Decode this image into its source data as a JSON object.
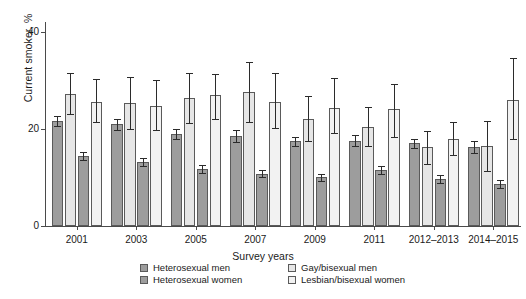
{
  "chart_data": {
    "type": "bar",
    "title": "",
    "xlabel": "Survey years",
    "ylabel": "Current smoker, %",
    "categories": [
      "2001",
      "2003",
      "2005",
      "2007",
      "2009",
      "2011",
      "2012–2013",
      "2014–2015"
    ],
    "ylim": [
      0,
      42
    ],
    "yticks": [
      0,
      20,
      40
    ],
    "ytick_labels": [
      "0",
      "20",
      "40"
    ],
    "grid": false,
    "legend_position": "bottom",
    "error_bars": "95% CI",
    "series": [
      {
        "name": "Heterosexual men",
        "color": "#9d9d9d",
        "values": [
          21.6,
          20.9,
          18.9,
          18.5,
          17.4,
          17.6,
          17.0,
          16.3
        ],
        "ci_low": [
          20.6,
          19.7,
          17.9,
          17.3,
          16.4,
          16.4,
          16.0,
          15.0
        ],
        "ci_high": [
          22.6,
          22.1,
          19.9,
          19.7,
          18.4,
          18.8,
          18.0,
          17.6
        ]
      },
      {
        "name": "Gay/bisexual men",
        "color": "#e6e6e6",
        "values": [
          27.2,
          25.3,
          26.3,
          27.6,
          22.1,
          20.4,
          16.2,
          16.5
        ],
        "ci_low": [
          23.0,
          20.0,
          21.2,
          21.4,
          17.5,
          16.4,
          12.8,
          11.4
        ],
        "ci_high": [
          31.4,
          30.6,
          31.4,
          33.8,
          26.7,
          24.4,
          19.6,
          21.6
        ]
      },
      {
        "name": "Heterosexual women",
        "color": "#9d9d9d",
        "values": [
          14.4,
          13.2,
          11.8,
          10.8,
          10.0,
          11.5,
          9.7,
          8.7
        ],
        "ci_low": [
          13.6,
          12.4,
          11.0,
          10.0,
          9.2,
          10.7,
          8.9,
          7.9
        ],
        "ci_high": [
          15.2,
          14.0,
          12.6,
          11.6,
          10.8,
          12.3,
          10.5,
          9.5
        ]
      },
      {
        "name": "Lesbian/bisexual women",
        "color": "#f2f2f2",
        "values": [
          25.6,
          24.7,
          27.0,
          25.6,
          24.3,
          24.1,
          18.0,
          26.0
        ],
        "ci_low": [
          21.4,
          19.7,
          22.0,
          20.1,
          19.2,
          18.4,
          14.6,
          17.9
        ],
        "ci_high": [
          30.2,
          30.0,
          31.2,
          31.6,
          30.4,
          29.3,
          21.4,
          34.6
        ]
      }
    ]
  },
  "legend": {
    "items": [
      {
        "label": "Heterosexual men"
      },
      {
        "label": "Gay/bisexual men"
      },
      {
        "label": "Heterosexual women"
      },
      {
        "label": "Lesbian/bisexual women"
      }
    ]
  }
}
